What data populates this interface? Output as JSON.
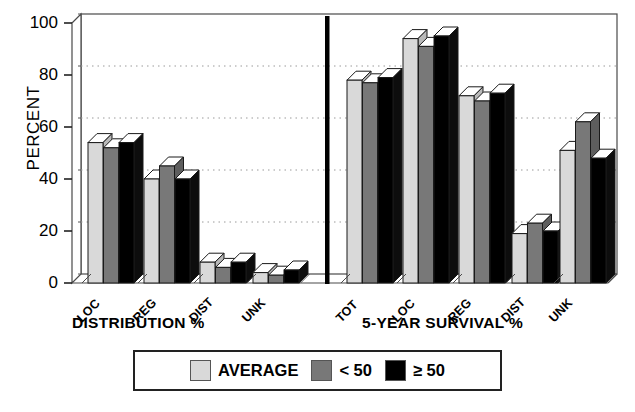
{
  "chart_data": {
    "type": "bar",
    "title": "",
    "ylabel": "PERCENT",
    "ylim": [
      0,
      100
    ],
    "yticks": [
      0,
      20,
      40,
      60,
      80,
      100
    ],
    "gridlines": [
      20,
      40,
      60,
      80,
      100
    ],
    "grid": true,
    "legend_position": "bottom",
    "panels": [
      {
        "xlabel": "DISTRIBUTION %",
        "categories": [
          "LOC",
          "REG",
          "DIST",
          "UNK"
        ],
        "series": [
          {
            "name": "AVERAGE",
            "color": "#d9d9d9",
            "values": [
              54,
              40,
              8,
              4
            ]
          },
          {
            "name": "< 50",
            "color": "#787878",
            "values": [
              52,
              45,
              6,
              3
            ]
          },
          {
            "name": "≥ 50",
            "color": "#000000",
            "values": [
              54,
              40,
              8,
              5
            ]
          }
        ]
      },
      {
        "xlabel": "5-YEAR SURVIVAL %",
        "categories": [
          "TOT",
          "LOC",
          "REG",
          "DIST",
          "UNK"
        ],
        "series": [
          {
            "name": "AVERAGE",
            "color": "#d9d9d9",
            "values": [
              78,
              94,
              72,
              19,
              51
            ]
          },
          {
            "name": "< 50",
            "color": "#787878",
            "values": [
              77,
              91,
              70,
              23,
              62
            ]
          },
          {
            "name": "≥ 50",
            "color": "#000000",
            "values": [
              79,
              95,
              73,
              20,
              48
            ]
          }
        ]
      }
    ],
    "legend": [
      {
        "label": "AVERAGE",
        "color": "#d9d9d9"
      },
      {
        "label": "< 50",
        "color": "#787878"
      },
      {
        "label": "≥ 50",
        "color": "#000000"
      }
    ]
  }
}
